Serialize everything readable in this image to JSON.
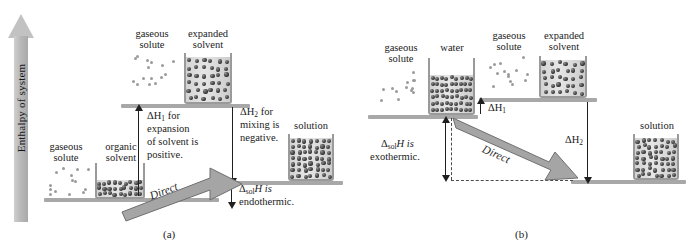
{
  "figure": {
    "axis_label": "Enthalpy of system",
    "axis_icon": "up-arrow-icon"
  },
  "panel_a": {
    "caption": "(a)",
    "labels": {
      "gaseous_solute": "gaseous\nsolute",
      "gaseous_solute_line1": "gaseous",
      "gaseous_solute_line2": "solute",
      "organic_solvent_line1": "organic",
      "organic_solvent_line2": "solvent",
      "gaseous_solute_top_line1": "gaseous",
      "gaseous_solute_top_line2": "solute",
      "expanded_solvent_line1": "expanded",
      "expanded_solvent_line2": "solvent",
      "solution": "solution"
    },
    "annotations": {
      "dh1_line1_pre": "ΔH",
      "dh1_sub": "1",
      "dh1_line1_post": " for",
      "dh1_line2": "expansion",
      "dh1_line3": "of solvent is",
      "dh1_line4": "positive.",
      "dh2_line1_pre": "ΔH",
      "dh2_sub": "2",
      "dh2_line1_post": " for",
      "dh2_line2": "mixing is",
      "dh2_line3": "negative.",
      "dsol_pre": "Δ",
      "dsol_sub": "sol",
      "dsol_post": "H is",
      "dsol_line2": "endothermic.",
      "direct": "Direct"
    }
  },
  "panel_b": {
    "caption": "(b)",
    "labels": {
      "gaseous_solute_line1": "gaseous",
      "gaseous_solute_line2": "solute",
      "water": "water",
      "gaseous_solute_top_line1": "gaseous",
      "gaseous_solute_top_line2": "solute",
      "expanded_solvent_line1": "expanded",
      "expanded_solvent_line2": "solvent",
      "solution": "solution"
    },
    "annotations": {
      "dh1_pre": "ΔH",
      "dh1_sub": "1",
      "dh2_pre": "ΔH",
      "dh2_sub": "2",
      "dsol_pre": "Δ",
      "dsol_sub": "sol",
      "dsol_post": "H is",
      "dsol_line2": "exothermic.",
      "direct": "Direct"
    }
  },
  "colors": {
    "shelf": "#a8a8a8",
    "arrow_fill": "#a5a5a5",
    "arrow_stroke": "#6f6f6f",
    "solute_dot": "#2e2e2e",
    "gas_dot": "#9b9b9b",
    "text": "#1b1b1b"
  }
}
